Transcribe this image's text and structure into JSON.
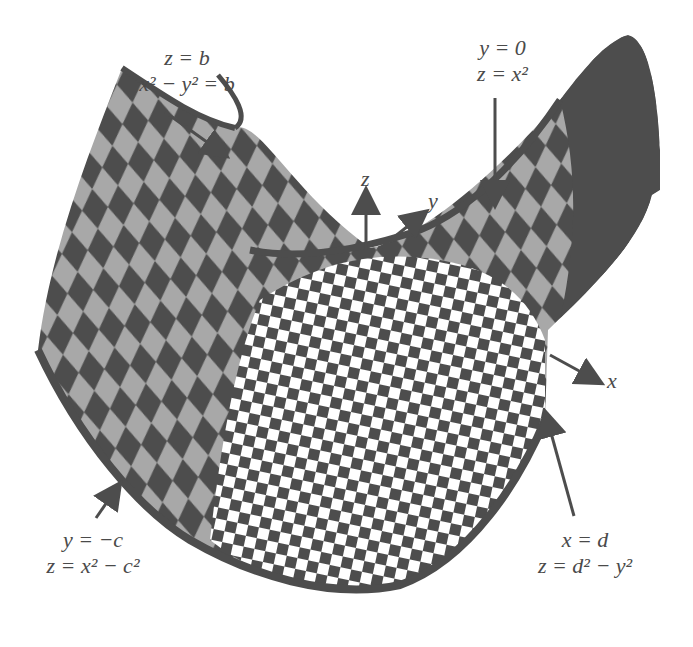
{
  "figure": {
    "colors": {
      "dark": "#4d4d4d",
      "light_speckle": "#a8a8a8",
      "white": "#ffffff",
      "text": "#4a4a4a"
    }
  },
  "axes": {
    "x": "x",
    "y": "y",
    "z": "z"
  },
  "labels": {
    "top_left": {
      "line1": "z = b",
      "line2": "x² − y² = b"
    },
    "top_right": {
      "line1": "y = 0",
      "line2": "z = x²"
    },
    "bottom_left": {
      "line1": "y = −c",
      "line2": "z = x² − c²"
    },
    "bottom_right": {
      "line1": "x = d",
      "line2": "z = d² − y²"
    }
  }
}
